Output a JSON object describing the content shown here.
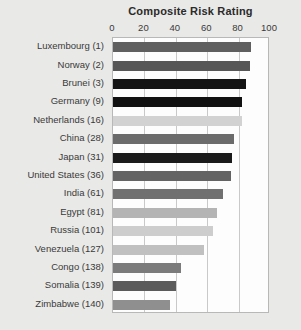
{
  "chart_data": {
    "type": "bar",
    "orientation": "horizontal",
    "title": "Composite Risk Rating",
    "xlabel": "",
    "ylabel": "",
    "xlim": [
      0,
      100
    ],
    "xticks": [
      0,
      20,
      40,
      60,
      80,
      100
    ],
    "xtick_labels": [
      "0",
      "20",
      "40",
      "60",
      "80",
      "100"
    ],
    "grid": true,
    "legend": false,
    "categories": [
      "Luxembourg (1)",
      "Norway (2)",
      "Brunei (3)",
      "Germany (9)",
      "Netherlands (16)",
      "China (28)",
      "Japan (31)",
      "United States (36)",
      "India (61)",
      "Egypt (81)",
      "Russia (101)",
      "Venezuela (127)",
      "Congo (138)",
      "Somalia (139)",
      "Zimbabwe (140)"
    ],
    "values": [
      88,
      87,
      85,
      82,
      82,
      77,
      76,
      75,
      70,
      66,
      64,
      58,
      43,
      40,
      36
    ],
    "bar_colors": [
      "#5f5f5f",
      "#565656",
      "#141414",
      "#111111",
      "#d2d2d2",
      "#6b6b6b",
      "#1a1a1a",
      "#636363",
      "#707070",
      "#b4b4b4",
      "#cdcdcd",
      "#c0c0c0",
      "#7b7b7b",
      "#5b5b5b",
      "#8f8f8f"
    ]
  },
  "style": {
    "page_background": "#e9e9e7",
    "plot_background": "#fdfdfd",
    "gridline_color": "#c9c9c9",
    "axis_border_color": "#b8b8b8",
    "text_color": "#3a3a3a",
    "title_color": "#2b2b2b"
  }
}
